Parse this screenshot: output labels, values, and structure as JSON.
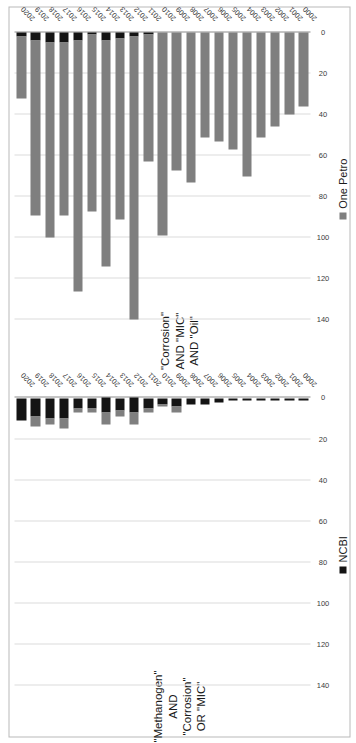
{
  "figure": {
    "orientation": "rotated-90-ccw",
    "legend": [
      {
        "name": "one-petro",
        "label": "One Petro",
        "color": "#7f7f7f"
      },
      {
        "name": "ncbi",
        "label": "NCBI",
        "color": "#141414"
      }
    ]
  },
  "chart_data": [
    {
      "id": "methanogen",
      "type": "bar",
      "orientation": "horizontal-stacked",
      "title": "\"Methanogen\" AND \"Corrosion\"\nOR \"MIC\"",
      "xlabel": "",
      "ylabel": "",
      "xlim": [
        0,
        140
      ],
      "xticks": [
        0,
        20,
        40,
        60,
        80,
        100,
        120,
        140
      ],
      "xticklabels": [
        "0",
        "20",
        "40",
        "60",
        "80",
        "100",
        "120",
        "140"
      ],
      "grid": true,
      "legend_position": "bottom",
      "categories": [
        "2000",
        "2001",
        "2002",
        "2003",
        "2004",
        "2005",
        "2006",
        "2007",
        "2008",
        "2009",
        "2010",
        "2011",
        "2012",
        "2013",
        "2014",
        "2015",
        "2016",
        "2017",
        "2018",
        "2019",
        "2020"
      ],
      "series": [
        {
          "name": "NCBI",
          "color": "#141414",
          "values": [
            1,
            1,
            1,
            1,
            1,
            1,
            2,
            3,
            3,
            4,
            3,
            5,
            7,
            6,
            7,
            5,
            5,
            10,
            10,
            9,
            11
          ]
        },
        {
          "name": "One Petro",
          "color": "#7f7f7f",
          "values": [
            0,
            0,
            0,
            0,
            0,
            0,
            0,
            0,
            0,
            3,
            1,
            2,
            6,
            3,
            6,
            2,
            2,
            5,
            3,
            5,
            0
          ]
        }
      ]
    },
    {
      "id": "corrosion-mic-oil",
      "type": "bar",
      "orientation": "horizontal-stacked",
      "title": "\"Corrosion\" AND \"MIC\" AND \"Oil\"",
      "xlabel": "",
      "ylabel": "",
      "xlim": [
        0,
        140
      ],
      "xticks": [
        0,
        20,
        40,
        60,
        80,
        100,
        120,
        140
      ],
      "xticklabels": [
        "0",
        "20",
        "40",
        "60",
        "80",
        "100",
        "120",
        "140"
      ],
      "grid": true,
      "legend_position": "bottom",
      "categories": [
        "2000",
        "2001",
        "2002",
        "2003",
        "2004",
        "2005",
        "2006",
        "2007",
        "2008",
        "2009",
        "2010",
        "2011",
        "2012",
        "2013",
        "2014",
        "2015",
        "2016",
        "2017",
        "2018",
        "2019",
        "2020"
      ],
      "series": [
        {
          "name": "NCBI",
          "color": "#141414",
          "values": [
            0,
            0,
            0,
            0,
            0,
            0,
            0,
            0,
            0,
            0,
            0,
            1,
            2,
            3,
            4,
            1,
            4,
            5,
            5,
            4,
            2
          ]
        },
        {
          "name": "One Petro",
          "color": "#7f7f7f",
          "values": [
            36,
            40,
            46,
            51,
            70,
            57,
            53,
            51,
            73,
            67,
            99,
            62,
            138,
            88,
            110,
            86,
            122,
            84,
            95,
            85,
            30
          ]
        }
      ]
    }
  ]
}
